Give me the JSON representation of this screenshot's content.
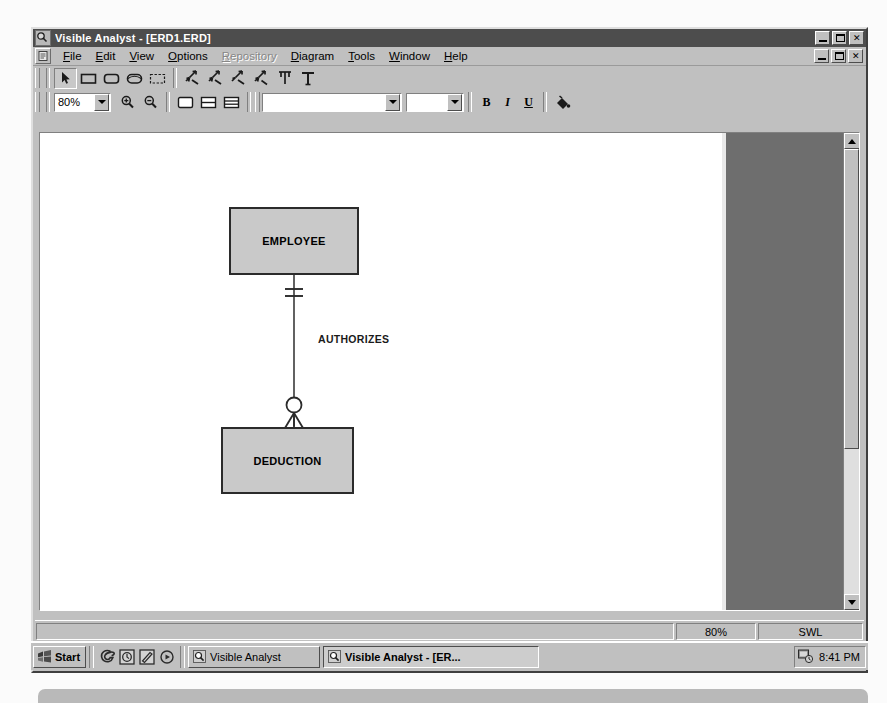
{
  "window": {
    "title": "Visible Analyst - [ERD1.ERD]",
    "app_icon": "magnifier-icon",
    "controls": {
      "minimize": "minimize-button",
      "restore": "restore-button",
      "close": "close-button"
    }
  },
  "menu": {
    "system_icon": "document-icon",
    "items": [
      {
        "label": "File",
        "mnemonic": "F",
        "disabled": false
      },
      {
        "label": "Edit",
        "mnemonic": "E",
        "disabled": false
      },
      {
        "label": "View",
        "mnemonic": "V",
        "disabled": false
      },
      {
        "label": "Options",
        "mnemonic": "O",
        "disabled": false
      },
      {
        "label": "Repository",
        "mnemonic": "R",
        "disabled": true
      },
      {
        "label": "Diagram",
        "mnemonic": "D",
        "disabled": false
      },
      {
        "label": "Tools",
        "mnemonic": "T",
        "disabled": false
      },
      {
        "label": "Window",
        "mnemonic": "W",
        "disabled": false
      },
      {
        "label": "Help",
        "mnemonic": "H",
        "disabled": false
      }
    ]
  },
  "toolbar_draw": {
    "tools": [
      {
        "name": "select-pointer-tool",
        "icon": "arrow-cursor-icon",
        "pressed": true
      },
      {
        "name": "entity-rectangle-tool",
        "icon": "rectangle-icon",
        "pressed": false
      },
      {
        "name": "rounded-entity-tool",
        "icon": "rounded-rectangle-icon",
        "pressed": false
      },
      {
        "name": "attributive-entity-tool",
        "icon": "ellipse-rectangle-icon",
        "pressed": false
      },
      {
        "name": "associative-entity-tool",
        "icon": "dashed-rectangle-icon",
        "pressed": false
      },
      {
        "name": "relationship-one-tool",
        "icon": "crowsfoot-line-icon",
        "pressed": false
      },
      {
        "name": "relationship-many-tool",
        "icon": "crowsfoot-line-icon",
        "pressed": false
      },
      {
        "name": "relationship-optional-tool",
        "icon": "crowsfoot-line-icon",
        "pressed": false
      },
      {
        "name": "relationship-mandatory-tool",
        "icon": "crowsfoot-line-icon",
        "pressed": false
      },
      {
        "name": "supertype-line-tool",
        "icon": "fork-line-icon",
        "pressed": false
      },
      {
        "name": "text-tool",
        "icon": "text-t-icon",
        "pressed": false
      }
    ]
  },
  "toolbar_format": {
    "zoom_combo": {
      "value": "80%",
      "name": "zoom-level-combo"
    },
    "zoom_in": "zoom-in-button",
    "zoom_out": "zoom-out-button",
    "view_buttons": [
      {
        "name": "view-normal-button",
        "icon": "page-view-icon"
      },
      {
        "name": "view-split-button",
        "icon": "split-view-icon"
      },
      {
        "name": "view-list-button",
        "icon": "list-view-icon"
      }
    ],
    "font_combo": {
      "value": "",
      "name": "font-family-combo"
    },
    "size_combo": {
      "value": "",
      "name": "font-size-combo"
    },
    "bold_label": "B",
    "italic_label": "I",
    "underline_label": "U",
    "color_button": "paint-color-icon"
  },
  "diagram": {
    "entities": [
      {
        "label": "EMPLOYEE",
        "name": "entity-employee"
      },
      {
        "label": "DEDUCTION",
        "name": "entity-deduction"
      }
    ],
    "relationship": {
      "label": "AUTHORIZES",
      "name": "relationship-authorizes",
      "from_cardinality": "one-and-only-one",
      "to_cardinality": "zero-or-many"
    }
  },
  "statusbar": {
    "message": "",
    "zoom": "80%",
    "mode": "SWL"
  },
  "taskbar": {
    "start_label": "Start",
    "quick_launch": [
      {
        "name": "internet-explorer-icon",
        "icon": "e-icon"
      },
      {
        "name": "outlook-express-icon",
        "icon": "mail-icon"
      },
      {
        "name": "show-desktop-icon",
        "icon": "desktop-icon"
      },
      {
        "name": "media-player-icon",
        "icon": "media-icon"
      }
    ],
    "tasks": [
      {
        "label": "Visible Analyst",
        "active": false,
        "name": "task-visible-analyst"
      },
      {
        "label": "Visible Analyst - [ER...",
        "active": true,
        "name": "task-visible-analyst-erd"
      }
    ],
    "tray": {
      "icon": "tray-status-icon",
      "clock": "8:41 PM"
    }
  }
}
